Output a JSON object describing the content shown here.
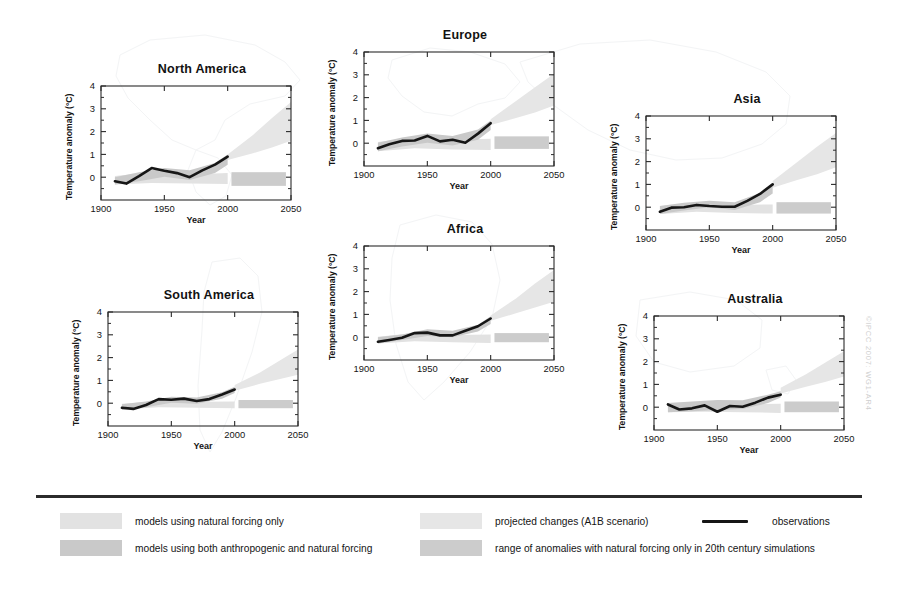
{
  "figure": {
    "credit": "©IPCC 2007: WG1-AR4"
  },
  "axes": {
    "xlabel": "Year",
    "ylabel": "Temperature anomaly (°C)",
    "xticks": [
      "1900",
      "1950",
      "2000",
      "2050"
    ],
    "xtick_values": [
      1900,
      1950,
      2000,
      2050
    ],
    "yticks": [
      "0",
      "1",
      "2",
      "3",
      "4"
    ],
    "ytick_values": [
      0,
      1,
      2,
      3,
      4
    ],
    "xlim": [
      1900,
      2050
    ],
    "ylim": [
      -1,
      4
    ]
  },
  "legend": {
    "items": [
      {
        "id": "natural-only",
        "label": "models using natural forcing only",
        "color": "#e2e2e2"
      },
      {
        "id": "anthro-natural",
        "label": "models using both anthropogenic and natural forcing",
        "color": "#c9c9c9"
      },
      {
        "id": "projected-a1b",
        "label": "projected changes (A1B scenario)",
        "color": "#e6e6e6"
      },
      {
        "id": "natural-range-20c",
        "label": "range of anomalies with natural forcing only in 20th century simulations",
        "color": "#cccccc"
      },
      {
        "id": "observations",
        "label": "observations",
        "color": "#161616"
      }
    ]
  },
  "chart_data": {
    "type": "line",
    "xlabel": "Year",
    "ylabel": "Temperature anomaly (°C)",
    "xlim": [
      1900,
      2050
    ],
    "ylim": [
      -1,
      4
    ],
    "grid": false,
    "legend_position": "bottom",
    "panels": [
      {
        "name": "North America",
        "observations": {
          "x": [
            1911,
            1920,
            1930,
            1940,
            1950,
            1960,
            1970,
            1980,
            1990,
            2000
          ],
          "y": [
            -0.18,
            -0.28,
            0.05,
            0.4,
            0.28,
            0.18,
            0.0,
            0.3,
            0.55,
            0.9
          ]
        },
        "band_anthro_natural": {
          "x": [
            1911,
            1930,
            1950,
            1970,
            1990,
            2000
          ],
          "upper": [
            0.0,
            0.22,
            0.4,
            0.3,
            0.62,
            1.0
          ],
          "lower": [
            -0.32,
            -0.18,
            0.02,
            -0.12,
            0.18,
            0.55
          ]
        },
        "band_natural_only": {
          "x": [
            1911,
            1940,
            1970,
            2000
          ],
          "upper": [
            0.05,
            0.22,
            0.12,
            0.18
          ],
          "lower": [
            -0.32,
            -0.25,
            -0.28,
            -0.3
          ]
        },
        "projection_a1b": {
          "x": [
            2000,
            2020,
            2035,
            2050
          ],
          "upper": [
            1.0,
            1.85,
            2.6,
            3.3
          ],
          "lower": [
            0.75,
            1.05,
            1.3,
            1.6
          ]
        },
        "natural_range_future": {
          "x_start": 2003,
          "x_end": 2046,
          "upper": 0.22,
          "lower": -0.38
        }
      },
      {
        "name": "South America",
        "observations": {
          "x": [
            1911,
            1920,
            1930,
            1940,
            1950,
            1960,
            1970,
            1980,
            1990,
            2000
          ],
          "y": [
            -0.2,
            -0.25,
            -0.08,
            0.18,
            0.15,
            0.2,
            0.1,
            0.18,
            0.38,
            0.6
          ]
        },
        "band_anthro_natural": {
          "x": [
            1911,
            1930,
            1950,
            1970,
            1990,
            2000
          ],
          "upper": [
            -0.05,
            0.08,
            0.28,
            0.25,
            0.48,
            0.72
          ],
          "lower": [
            -0.3,
            -0.18,
            0.02,
            -0.02,
            0.2,
            0.45
          ]
        },
        "band_natural_only": {
          "x": [
            1911,
            1940,
            1970,
            2000
          ],
          "upper": [
            -0.02,
            0.1,
            0.06,
            0.08
          ],
          "lower": [
            -0.28,
            -0.18,
            -0.2,
            -0.22
          ]
        },
        "projection_a1b": {
          "x": [
            2000,
            2020,
            2035,
            2050
          ],
          "upper": [
            0.8,
            1.35,
            1.85,
            2.35
          ],
          "lower": [
            0.55,
            0.85,
            1.05,
            1.25
          ]
        },
        "natural_range_future": {
          "x_start": 2003,
          "x_end": 2046,
          "upper": 0.14,
          "lower": -0.22
        }
      },
      {
        "name": "Europe",
        "observations": {
          "x": [
            1911,
            1920,
            1930,
            1940,
            1950,
            1960,
            1970,
            1980,
            1990,
            2000
          ],
          "y": [
            -0.22,
            -0.05,
            0.1,
            0.12,
            0.32,
            0.08,
            0.15,
            0.02,
            0.42,
            0.88
          ]
        },
        "band_anthro_natural": {
          "x": [
            1911,
            1930,
            1950,
            1970,
            1990,
            2000
          ],
          "upper": [
            0.02,
            0.25,
            0.42,
            0.32,
            0.6,
            1.0
          ],
          "lower": [
            -0.35,
            -0.15,
            0.02,
            -0.1,
            0.15,
            0.58
          ]
        },
        "band_natural_only": {
          "x": [
            1911,
            1940,
            1970,
            2000
          ],
          "upper": [
            0.05,
            0.25,
            0.15,
            0.2
          ],
          "lower": [
            -0.35,
            -0.22,
            -0.28,
            -0.3
          ]
        },
        "projection_a1b": {
          "x": [
            2000,
            2020,
            2035,
            2050
          ],
          "upper": [
            1.05,
            1.85,
            2.45,
            3.05
          ],
          "lower": [
            0.8,
            1.1,
            1.35,
            1.65
          ]
        },
        "natural_range_future": {
          "x_start": 2003,
          "x_end": 2046,
          "upper": 0.3,
          "lower": -0.25
        }
      },
      {
        "name": "Africa",
        "observations": {
          "x": [
            1911,
            1920,
            1930,
            1940,
            1950,
            1960,
            1970,
            1980,
            1990,
            2000
          ],
          "y": [
            -0.2,
            -0.12,
            -0.02,
            0.18,
            0.2,
            0.08,
            0.08,
            0.28,
            0.48,
            0.82
          ]
        },
        "band_anthro_natural": {
          "x": [
            1911,
            1930,
            1950,
            1970,
            1990,
            2000
          ],
          "upper": [
            0.0,
            0.12,
            0.35,
            0.28,
            0.55,
            0.92
          ],
          "lower": [
            -0.28,
            -0.12,
            0.05,
            0.0,
            0.25,
            0.58
          ]
        },
        "band_natural_only": {
          "x": [
            1911,
            1940,
            1970,
            2000
          ],
          "upper": [
            0.02,
            0.18,
            0.1,
            0.12
          ],
          "lower": [
            -0.28,
            -0.18,
            -0.22,
            -0.25
          ]
        },
        "projection_a1b": {
          "x": [
            2000,
            2020,
            2035,
            2050
          ],
          "upper": [
            0.95,
            1.7,
            2.35,
            2.95
          ],
          "lower": [
            0.72,
            1.05,
            1.3,
            1.55
          ]
        },
        "natural_range_future": {
          "x_start": 2003,
          "x_end": 2046,
          "upper": 0.18,
          "lower": -0.22
        }
      },
      {
        "name": "Asia",
        "observations": {
          "x": [
            1911,
            1920,
            1930,
            1940,
            1950,
            1960,
            1970,
            1980,
            1990,
            2000
          ],
          "y": [
            -0.2,
            -0.02,
            0.0,
            0.1,
            0.05,
            0.02,
            0.02,
            0.28,
            0.58,
            1.0
          ]
        },
        "band_anthro_natural": {
          "x": [
            1911,
            1930,
            1950,
            1970,
            1990,
            2000
          ],
          "upper": [
            0.05,
            0.2,
            0.28,
            0.22,
            0.62,
            1.05
          ],
          "lower": [
            -0.3,
            -0.15,
            0.0,
            -0.12,
            0.22,
            0.6
          ]
        },
        "band_natural_only": {
          "x": [
            1911,
            1940,
            1970,
            2000
          ],
          "upper": [
            0.05,
            0.18,
            0.1,
            0.12
          ],
          "lower": [
            -0.3,
            -0.2,
            -0.25,
            -0.28
          ]
        },
        "projection_a1b": {
          "x": [
            2000,
            2020,
            2035,
            2050
          ],
          "upper": [
            1.15,
            2.0,
            2.65,
            3.25
          ],
          "lower": [
            0.85,
            1.2,
            1.45,
            1.75
          ]
        },
        "natural_range_future": {
          "x_start": 2003,
          "x_end": 2046,
          "upper": 0.22,
          "lower": -0.28
        }
      },
      {
        "name": "Australia",
        "observations": {
          "x": [
            1911,
            1920,
            1930,
            1940,
            1950,
            1960,
            1970,
            1980,
            1990,
            2000
          ],
          "y": [
            0.12,
            -0.1,
            -0.05,
            0.08,
            -0.2,
            0.05,
            0.02,
            0.2,
            0.42,
            0.55
          ]
        },
        "band_anthro_natural": {
          "x": [
            1911,
            1930,
            1950,
            1970,
            1990,
            2000
          ],
          "upper": [
            0.18,
            0.25,
            0.32,
            0.3,
            0.55,
            0.7
          ],
          "lower": [
            -0.22,
            -0.18,
            -0.12,
            -0.08,
            0.18,
            0.42
          ]
        },
        "band_natural_only": {
          "x": [
            1911,
            1940,
            1970,
            2000
          ],
          "upper": [
            0.18,
            0.22,
            0.12,
            0.15
          ],
          "lower": [
            -0.22,
            -0.2,
            -0.22,
            -0.25
          ]
        },
        "projection_a1b": {
          "x": [
            2000,
            2020,
            2035,
            2050
          ],
          "upper": [
            0.85,
            1.45,
            1.95,
            2.45
          ],
          "lower": [
            0.6,
            0.9,
            1.1,
            1.35
          ]
        },
        "natural_range_future": {
          "x_start": 2003,
          "x_end": 2046,
          "upper": 0.25,
          "lower": -0.22
        }
      }
    ]
  }
}
